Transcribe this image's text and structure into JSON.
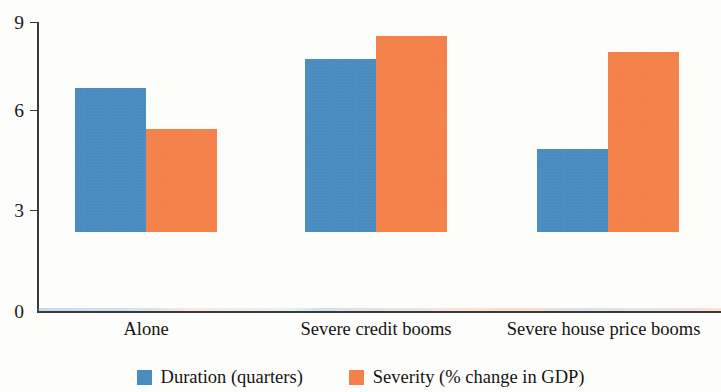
{
  "chart_data": {
    "type": "bar",
    "title": "",
    "subtitle": "",
    "xlabel": "",
    "ylabel": "",
    "ylim": [
      0,
      9
    ],
    "yticks": [
      0,
      3,
      6,
      9
    ],
    "ytick_labels": [
      "0",
      "3",
      "6",
      "9"
    ],
    "grid": false,
    "legend_position": "bottom",
    "categories": [
      "Alone",
      "Severe credit booms",
      "Severe house price booms"
    ],
    "series": [
      {
        "name": "Duration (quarters)",
        "color": "#4A8CC0",
        "values": [
          4.5,
          5.4,
          2.6
        ]
      },
      {
        "name": "Severity (% change in GDP)",
        "color": "#F5814A",
        "values": [
          3.2,
          6.1,
          5.6
        ]
      }
    ]
  },
  "axis": {
    "tick0": "0",
    "tick1": "3",
    "tick2": "6",
    "tick3": "9"
  },
  "categories": {
    "c0": "Alone",
    "c1": "Severe credit booms",
    "c2": "Severe house price booms"
  },
  "legend": {
    "item0": "Duration (quarters)",
    "item1": "Severity (% change in GDP)"
  },
  "colors": {
    "series_blue": "#4A8CC0",
    "series_orange": "#F5814A",
    "axis": "#3A3A3A",
    "background": "#FDFDFB"
  }
}
